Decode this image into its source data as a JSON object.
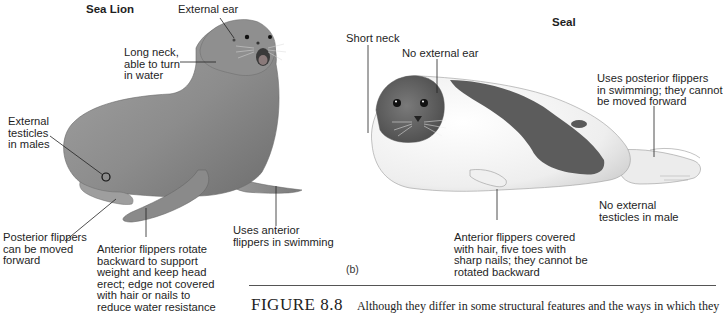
{
  "figure": {
    "number": "FIGURE 8.8",
    "caption": "Although they differ in some structural features and the ways in which they",
    "panel_label": "(b)"
  },
  "sea_lion": {
    "title": "Sea Lion",
    "labels": {
      "external_ear": "External ear",
      "long_neck": "Long neck,\nable to turn\nin water",
      "external_testicles": "External\ntesticles\nin males",
      "posterior_flippers": "Posterior flippers\ncan be moved\nforward",
      "anterior_flippers_rotate": "Anterior flippers rotate\nbackward to support\nweight and keep head\nerect; edge not covered\nwith hair or nails to\nreduce water resistance",
      "uses_anterior": "Uses anterior\nflippers in swimming"
    }
  },
  "seal": {
    "title": "Seal",
    "labels": {
      "short_neck": "Short neck",
      "no_external_ear": "No external ear",
      "uses_posterior": "Uses posterior flippers\nin swimming; they cannot\nbe moved forward",
      "no_external_testicles": "No external\ntesticles in male",
      "anterior_flippers_covered": "Anterior flippers covered\nwith hair, five toes with\nsharp nails; they cannot be\nrotated backward"
    }
  },
  "colors": {
    "sea_lion_body": "#8a8a8a",
    "seal_body": "#f2f2f2",
    "seal_spot": "#5c5c5c",
    "leader_line": "#222222"
  }
}
